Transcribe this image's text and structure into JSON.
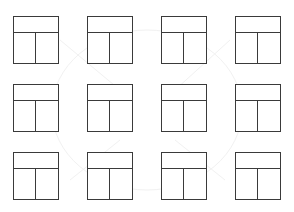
{
  "diagram": {
    "type": "wireframe-layout-grid",
    "rows": 3,
    "columns": 4,
    "stroke_color": "#3a3a3a",
    "background_color": "#ffffff",
    "tile": {
      "description": "header bar above two equal columns",
      "regions": [
        "header",
        "left-column",
        "right-column"
      ]
    },
    "tiles": [
      {
        "row": 1,
        "col": 1,
        "x": 13,
        "y": 16
      },
      {
        "row": 1,
        "col": 2,
        "x": 87,
        "y": 16
      },
      {
        "row": 1,
        "col": 3,
        "x": 161,
        "y": 16
      },
      {
        "row": 1,
        "col": 4,
        "x": 235,
        "y": 16
      },
      {
        "row": 2,
        "col": 1,
        "x": 13,
        "y": 84
      },
      {
        "row": 2,
        "col": 2,
        "x": 87,
        "y": 84
      },
      {
        "row": 2,
        "col": 3,
        "x": 161,
        "y": 84
      },
      {
        "row": 2,
        "col": 4,
        "x": 235,
        "y": 84
      },
      {
        "row": 3,
        "col": 1,
        "x": 13,
        "y": 152
      },
      {
        "row": 3,
        "col": 2,
        "x": 87,
        "y": 152
      },
      {
        "row": 3,
        "col": 3,
        "x": 161,
        "y": 152
      },
      {
        "row": 3,
        "col": 4,
        "x": 235,
        "y": 152
      }
    ]
  }
}
